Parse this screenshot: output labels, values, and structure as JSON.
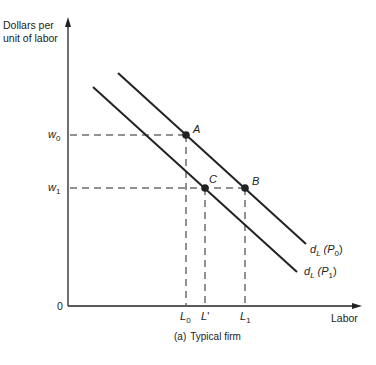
{
  "figure": {
    "caption_prefix": "(a)",
    "caption_text": "Typical firm"
  },
  "axes": {
    "y_label_line1": "Dollars per",
    "y_label_line2": "unit of labor",
    "x_label": "Labor",
    "origin_label": "0"
  },
  "y_ticks": [
    {
      "base": "w",
      "sub": "0"
    },
    {
      "base": "w",
      "sub": "1"
    }
  ],
  "x_ticks": [
    {
      "base": "L",
      "sub": "0",
      "prime": ""
    },
    {
      "base": "L",
      "sub": "",
      "prime": "'"
    },
    {
      "base": "L",
      "sub": "1",
      "prime": ""
    }
  ],
  "points": {
    "A": "A",
    "B": "B",
    "C": "C"
  },
  "curves": {
    "upper": {
      "base": "d",
      "sub": "L",
      "arg": "(P",
      "arg_sub": "0",
      "close": ")"
    },
    "lower": {
      "base": "d",
      "sub": "L",
      "arg": "(P",
      "arg_sub": "1",
      "close": ")"
    }
  },
  "colors": {
    "ink": "#222222",
    "background": "#ffffff"
  }
}
